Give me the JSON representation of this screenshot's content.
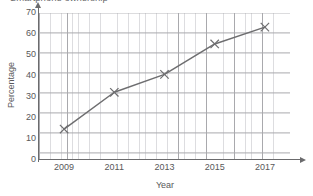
{
  "title": {
    "text": "Smartphone ownership",
    "clipped": true
  },
  "chart_data": {
    "type": "line",
    "title": "Smartphone ownership",
    "xlabel": "Year",
    "ylabel": "Percentage",
    "x": [
      2009,
      2011,
      2013,
      2015,
      2017
    ],
    "values": [
      14.5,
      32,
      40.5,
      55,
      63
    ],
    "categories": [
      "2009",
      "2011",
      "2013",
      "2015",
      "2017"
    ],
    "xlim": [
      2008,
      2018
    ],
    "ylim": [
      0,
      70
    ],
    "ytick_labels": [
      "0",
      "10",
      "20",
      "30",
      "40",
      "50",
      "60",
      "70"
    ],
    "ytick_values": [
      0,
      10,
      20,
      30,
      40,
      50,
      60,
      70
    ],
    "xtick_labels": [
      "2009",
      "2011",
      "2013",
      "2015",
      "2017"
    ],
    "xtick_values": [
      2009,
      2011,
      2013,
      2015,
      2017
    ],
    "grid": true,
    "minor_grid": true,
    "legend": false,
    "marker": "x",
    "line_color": "#6e6e70",
    "marker_color": "#6e6e70",
    "grid_major_color": "#a9a9ad",
    "grid_minor_color": "#dddde0",
    "axis_color": "#6b6b6d"
  },
  "icons": {
    "y_axis_arrow": "arrow-up-icon",
    "x_axis_arrow": "arrow-right-icon"
  }
}
